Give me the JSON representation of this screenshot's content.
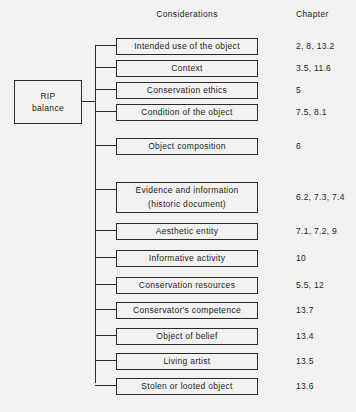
{
  "headers": {
    "considerations": "Considerations",
    "chapter": "Chapter"
  },
  "root": {
    "name": "RIP balance",
    "line1": "RIP",
    "line2": "balance"
  },
  "rows": [
    {
      "label": "Intended use of the object",
      "label2": "",
      "chapter": "2, 8, 13.2",
      "top": 38,
      "height": 17
    },
    {
      "label": "Context",
      "label2": "",
      "chapter": "3.5, 11.6",
      "top": 60,
      "height": 17
    },
    {
      "label": "Conservation ethics",
      "label2": "",
      "chapter": "5",
      "top": 82,
      "height": 17
    },
    {
      "label": "Condition of the object",
      "label2": "",
      "chapter": "7.5, 8.1",
      "top": 104,
      "height": 17
    },
    {
      "label": "Object composition",
      "label2": "",
      "chapter": "6",
      "top": 138,
      "height": 17
    },
    {
      "label": "Evidence and information",
      "label2": "(historic document)",
      "chapter": "6.2, 7.3, 7.4",
      "top": 182,
      "height": 31
    },
    {
      "label": "Aesthetic entity",
      "label2": "",
      "chapter": "7.1, 7.2, 9",
      "top": 223,
      "height": 17
    },
    {
      "label": "Informative activity",
      "label2": "",
      "chapter": "10",
      "top": 250,
      "height": 17
    },
    {
      "label": "Conservation resources",
      "label2": "",
      "chapter": "5.5, 12",
      "top": 277,
      "height": 17
    },
    {
      "label": "Conservator's competence",
      "label2": "",
      "chapter": "13.7",
      "top": 302,
      "height": 17
    },
    {
      "label": "Object of belief",
      "label2": "",
      "chapter": "13.4",
      "top": 328,
      "height": 17
    },
    {
      "label": "Living artist",
      "label2": "",
      "chapter": "13.5",
      "top": 353,
      "height": 17
    },
    {
      "label": "Stolen or looted object",
      "label2": "",
      "chapter": "13.6",
      "top": 378,
      "height": 17
    }
  ],
  "colors": {
    "background": "#f2f2f0",
    "line": "#2b2b2b",
    "text": "#1c1c1c"
  }
}
